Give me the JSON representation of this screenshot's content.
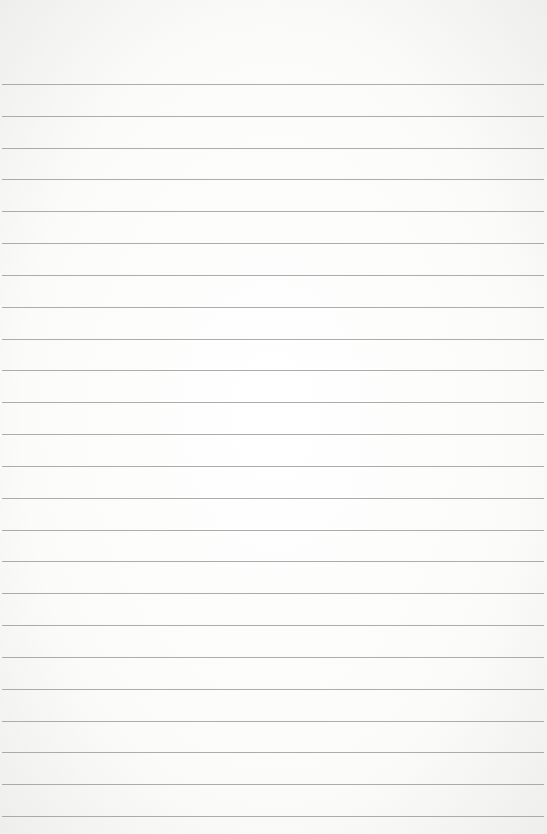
{
  "paper": {
    "type": "lined-paper",
    "background_color": "#fbfbfa",
    "line_color": "#9e9e9c",
    "first_line_y": 84,
    "line_spacing": 31.83,
    "line_count": 24
  }
}
